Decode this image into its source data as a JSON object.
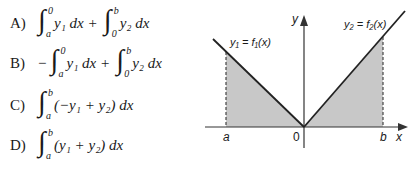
{
  "options": [
    {
      "label": "A)",
      "parts": [
        {
          "lower": "a",
          "upper": "0",
          "body": "y₁ dx +"
        },
        {
          "lower": "0",
          "upper": "b",
          "body": "y₂ dx"
        }
      ]
    },
    {
      "label": "B)",
      "prefix": "−",
      "parts": [
        {
          "lower": "a",
          "upper": "0",
          "body": "y₁ dx +"
        },
        {
          "lower": "0",
          "upper": "b",
          "body": "y₂ dx"
        }
      ]
    },
    {
      "label": "C)",
      "parts": [
        {
          "lower": "a",
          "upper": "b",
          "body": "(−y₁ + y₂) dx"
        }
      ]
    },
    {
      "label": "D)",
      "parts": [
        {
          "lower": "a",
          "upper": "b",
          "body": "(y₁ + y₂) dx"
        }
      ]
    }
  ],
  "graph": {
    "y_axis_label": "y",
    "x_axis_label": "x",
    "origin_label": "0",
    "a_label": "a",
    "b_label": "b",
    "curve1_label": "y₁ = f₁(x)",
    "curve2_label": "y₂ = f₂(x)",
    "shade_color": "#c8c8c8",
    "line_color": "#222222"
  }
}
